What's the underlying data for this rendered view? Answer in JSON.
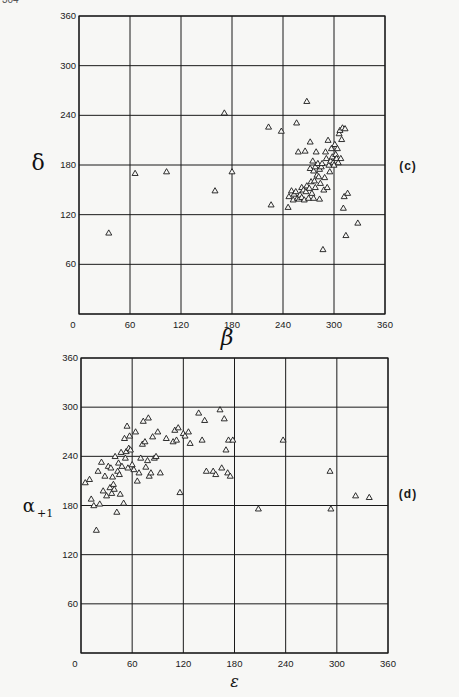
{
  "page": {
    "number_fragment": "304"
  },
  "chart_data": [
    {
      "id": "c",
      "type": "scatter",
      "panel_label": "(c)",
      "title": "",
      "xlabel": "β",
      "ylabel": "δ",
      "xlim": [
        0,
        360
      ],
      "ylim": [
        0,
        360
      ],
      "xticks": [
        "0",
        "60",
        "120",
        "180",
        "240",
        "300",
        "360"
      ],
      "yticks": [
        "0",
        "60",
        "120",
        "180",
        "240",
        "300",
        "360"
      ],
      "grid": true,
      "marker": "triangle-open",
      "points": [
        [
          35,
          98
        ],
        [
          66,
          170
        ],
        [
          103,
          172
        ],
        [
          160,
          149
        ],
        [
          171,
          243
        ],
        [
          180,
          172
        ],
        [
          223,
          226
        ],
        [
          226,
          132
        ],
        [
          238,
          221
        ],
        [
          246,
          129
        ],
        [
          247,
          142
        ],
        [
          250,
          149
        ],
        [
          252,
          138
        ],
        [
          253,
          145
        ],
        [
          255,
          148
        ],
        [
          256,
          231
        ],
        [
          257,
          140
        ],
        [
          258,
          196
        ],
        [
          259,
          139
        ],
        [
          260,
          144
        ],
        [
          262,
          153
        ],
        [
          262,
          141
        ],
        [
          264,
          150
        ],
        [
          265,
          138
        ],
        [
          266,
          197
        ],
        [
          267,
          148
        ],
        [
          268,
          155
        ],
        [
          268,
          257
        ],
        [
          270,
          140
        ],
        [
          271,
          152
        ],
        [
          272,
          208
        ],
        [
          272,
          176
        ],
        [
          273,
          160
        ],
        [
          274,
          146
        ],
        [
          275,
          185
        ],
        [
          276,
          173
        ],
        [
          276,
          140
        ],
        [
          277,
          161
        ],
        [
          278,
          178
        ],
        [
          278,
          153
        ],
        [
          279,
          196
        ],
        [
          280,
          168
        ],
        [
          281,
          182
        ],
        [
          282,
          166
        ],
        [
          283,
          175
        ],
        [
          283,
          139
        ],
        [
          284,
          158
        ],
        [
          285,
          178
        ],
        [
          286,
          182
        ],
        [
          287,
          78
        ],
        [
          288,
          150
        ],
        [
          289,
          165
        ],
        [
          290,
          196
        ],
        [
          291,
          188
        ],
        [
          292,
          153
        ],
        [
          293,
          210
        ],
        [
          294,
          180
        ],
        [
          295,
          172
        ],
        [
          296,
          185
        ],
        [
          297,
          200
        ],
        [
          298,
          190
        ],
        [
          299,
          183
        ],
        [
          300,
          180
        ],
        [
          301,
          205
        ],
        [
          302,
          193
        ],
        [
          303,
          188
        ],
        [
          304,
          200
        ],
        [
          305,
          183
        ],
        [
          306,
          218
        ],
        [
          307,
          222
        ],
        [
          308,
          188
        ],
        [
          309,
          211
        ],
        [
          310,
          225
        ],
        [
          311,
          128
        ],
        [
          312,
          142
        ],
        [
          313,
          224
        ],
        [
          314,
          95
        ],
        [
          316,
          146
        ],
        [
          328,
          110
        ]
      ]
    },
    {
      "id": "d",
      "type": "scatter",
      "panel_label": "(d)",
      "title": "",
      "xlabel": "ε",
      "ylabel": "α+1",
      "xlim": [
        0,
        360
      ],
      "ylim": [
        0,
        360
      ],
      "xticks": [
        "0",
        "60",
        "120",
        "180",
        "240",
        "300",
        "360"
      ],
      "yticks": [
        "0",
        "60",
        "120",
        "180",
        "240",
        "300",
        "360"
      ],
      "grid": true,
      "marker": "triangle-open",
      "points": [
        [
          5,
          208
        ],
        [
          10,
          212
        ],
        [
          12,
          188
        ],
        [
          15,
          180
        ],
        [
          18,
          150
        ],
        [
          20,
          222
        ],
        [
          22,
          182
        ],
        [
          24,
          233
        ],
        [
          26,
          198
        ],
        [
          28,
          216
        ],
        [
          30,
          192
        ],
        [
          32,
          228
        ],
        [
          34,
          202
        ],
        [
          35,
          226
        ],
        [
          36,
          195
        ],
        [
          37,
          215
        ],
        [
          38,
          206
        ],
        [
          39,
          200
        ],
        [
          40,
          240
        ],
        [
          42,
          172
        ],
        [
          43,
          222
        ],
        [
          44,
          232
        ],
        [
          45,
          218
        ],
        [
          46,
          194
        ],
        [
          47,
          245
        ],
        [
          48,
          228
        ],
        [
          50,
          183
        ],
        [
          51,
          262
        ],
        [
          52,
          238
        ],
        [
          53,
          246
        ],
        [
          54,
          277
        ],
        [
          55,
          226
        ],
        [
          56,
          250
        ],
        [
          57,
          265
        ],
        [
          58,
          248
        ],
        [
          60,
          230
        ],
        [
          62,
          224
        ],
        [
          64,
          270
        ],
        [
          66,
          210
        ],
        [
          68,
          220
        ],
        [
          70,
          238
        ],
        [
          72,
          255
        ],
        [
          73,
          283
        ],
        [
          75,
          258
        ],
        [
          76,
          227
        ],
        [
          78,
          235
        ],
        [
          79,
          287
        ],
        [
          80,
          216
        ],
        [
          82,
          220
        ],
        [
          84,
          264
        ],
        [
          86,
          238
        ],
        [
          88,
          240
        ],
        [
          90,
          270
        ],
        [
          93,
          220
        ],
        [
          100,
          262
        ],
        [
          108,
          258
        ],
        [
          110,
          272
        ],
        [
          112,
          260
        ],
        [
          114,
          275
        ],
        [
          116,
          196
        ],
        [
          120,
          268
        ],
        [
          122,
          265
        ],
        [
          126,
          270
        ],
        [
          128,
          256
        ],
        [
          138,
          293
        ],
        [
          142,
          260
        ],
        [
          145,
          284
        ],
        [
          147,
          222
        ],
        [
          155,
          222
        ],
        [
          158,
          218
        ],
        [
          163,
          297
        ],
        [
          165,
          226
        ],
        [
          168,
          286
        ],
        [
          170,
          248
        ],
        [
          172,
          220
        ],
        [
          173,
          260
        ],
        [
          175,
          216
        ],
        [
          178,
          260
        ],
        [
          208,
          176
        ],
        [
          237,
          260
        ],
        [
          292,
          222
        ],
        [
          293,
          176
        ],
        [
          322,
          192
        ],
        [
          338,
          190
        ]
      ]
    }
  ]
}
